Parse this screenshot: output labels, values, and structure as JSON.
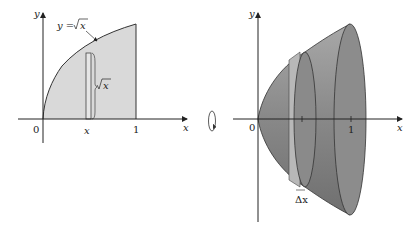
{
  "left_figure": {
    "curve_label": "y = √x",
    "curve_label_prefix": "y = ",
    "curve_label_radicand": "x",
    "strip_height_label": "x",
    "axis_labels": {
      "x": "x",
      "y": "y"
    },
    "tick_labels": {
      "origin": "0",
      "x_sample": "x",
      "one": "1"
    },
    "fill_color": "#d9d9d9"
  },
  "rotation_symbol": "rotate-about-x-axis",
  "right_figure": {
    "axis_labels": {
      "x": "x",
      "y": "y"
    },
    "tick_labels": {
      "origin": "0",
      "one": "1"
    },
    "slab_label": "Δx",
    "solid_color": "#8c8c8c"
  }
}
